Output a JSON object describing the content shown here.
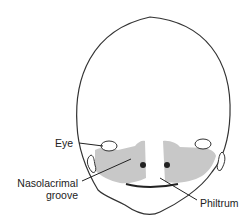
{
  "diagram": {
    "labels": {
      "eye": "Eye",
      "nasolacrimal_line1": "Nasolacrimal",
      "nasolacrimal_line2": "groove",
      "philtrum": "Philtrum"
    },
    "colors": {
      "outline": "#333333",
      "shaded_region": "#c8c8c8",
      "nostril": "#222222",
      "background": "#ffffff"
    }
  }
}
